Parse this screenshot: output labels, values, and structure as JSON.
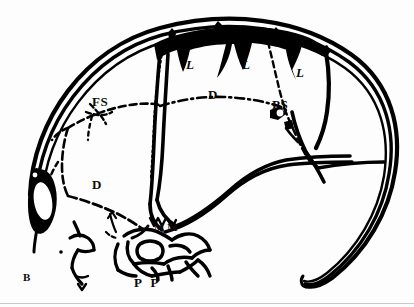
{
  "figure": {
    "panel_label": "B",
    "caption": "",
    "type": "anatomical line drawing",
    "ink_color": "#000000",
    "background_color": "#fdfdfd",
    "rule_color": "#c9c9c9",
    "width": 414,
    "height": 307
  },
  "labels": [
    {
      "id": "l-left",
      "text": "L",
      "x": 186,
      "y": 58,
      "desc": "lacrimal-left"
    },
    {
      "id": "l-mid",
      "text": "L",
      "x": 242,
      "y": 58,
      "desc": "lacrimal-middle"
    },
    {
      "id": "l-right",
      "text": "L",
      "x": 296,
      "y": 66,
      "desc": "lacrimal-right"
    },
    {
      "id": "d-upper",
      "text": "D",
      "x": 208,
      "y": 88,
      "desc": "dentary-upper"
    },
    {
      "id": "d-lower",
      "text": "D",
      "x": 92,
      "y": 178,
      "desc": "dentary-lower"
    },
    {
      "id": "fs",
      "text": "FS",
      "x": 92,
      "y": 95,
      "desc": "frontal-suture"
    },
    {
      "id": "ps",
      "text": "PS",
      "x": 272,
      "y": 98,
      "desc": "parietal-suture"
    },
    {
      "id": "mm",
      "text": "M M",
      "x": 154,
      "y": 222,
      "desc": "maxilla-pair"
    },
    {
      "id": "pp",
      "text": "P P",
      "x": 134,
      "y": 276,
      "desc": "premaxilla-pair"
    }
  ]
}
